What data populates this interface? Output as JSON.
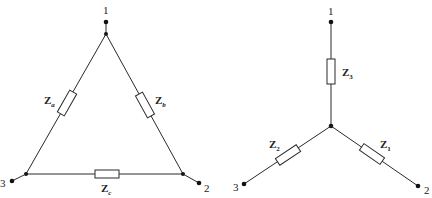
{
  "delta": {
    "nodes": [
      {
        "label": "1"
      },
      {
        "label": "2"
      },
      {
        "label": "3"
      }
    ],
    "impedances": [
      {
        "main": "Z",
        "sub": "a"
      },
      {
        "main": "Z",
        "sub": "b"
      },
      {
        "main": "Z",
        "sub": "c"
      }
    ]
  },
  "wye": {
    "nodes": [
      {
        "label": "1"
      },
      {
        "label": "2"
      },
      {
        "label": "3"
      }
    ],
    "impedances": [
      {
        "main": "Z",
        "sub": "1"
      },
      {
        "main": "Z",
        "sub": "2"
      },
      {
        "main": "Z",
        "sub": "3"
      }
    ]
  },
  "colors": {
    "line": "#2a2a2a",
    "dot": "#111111",
    "background": "#ffffff"
  }
}
